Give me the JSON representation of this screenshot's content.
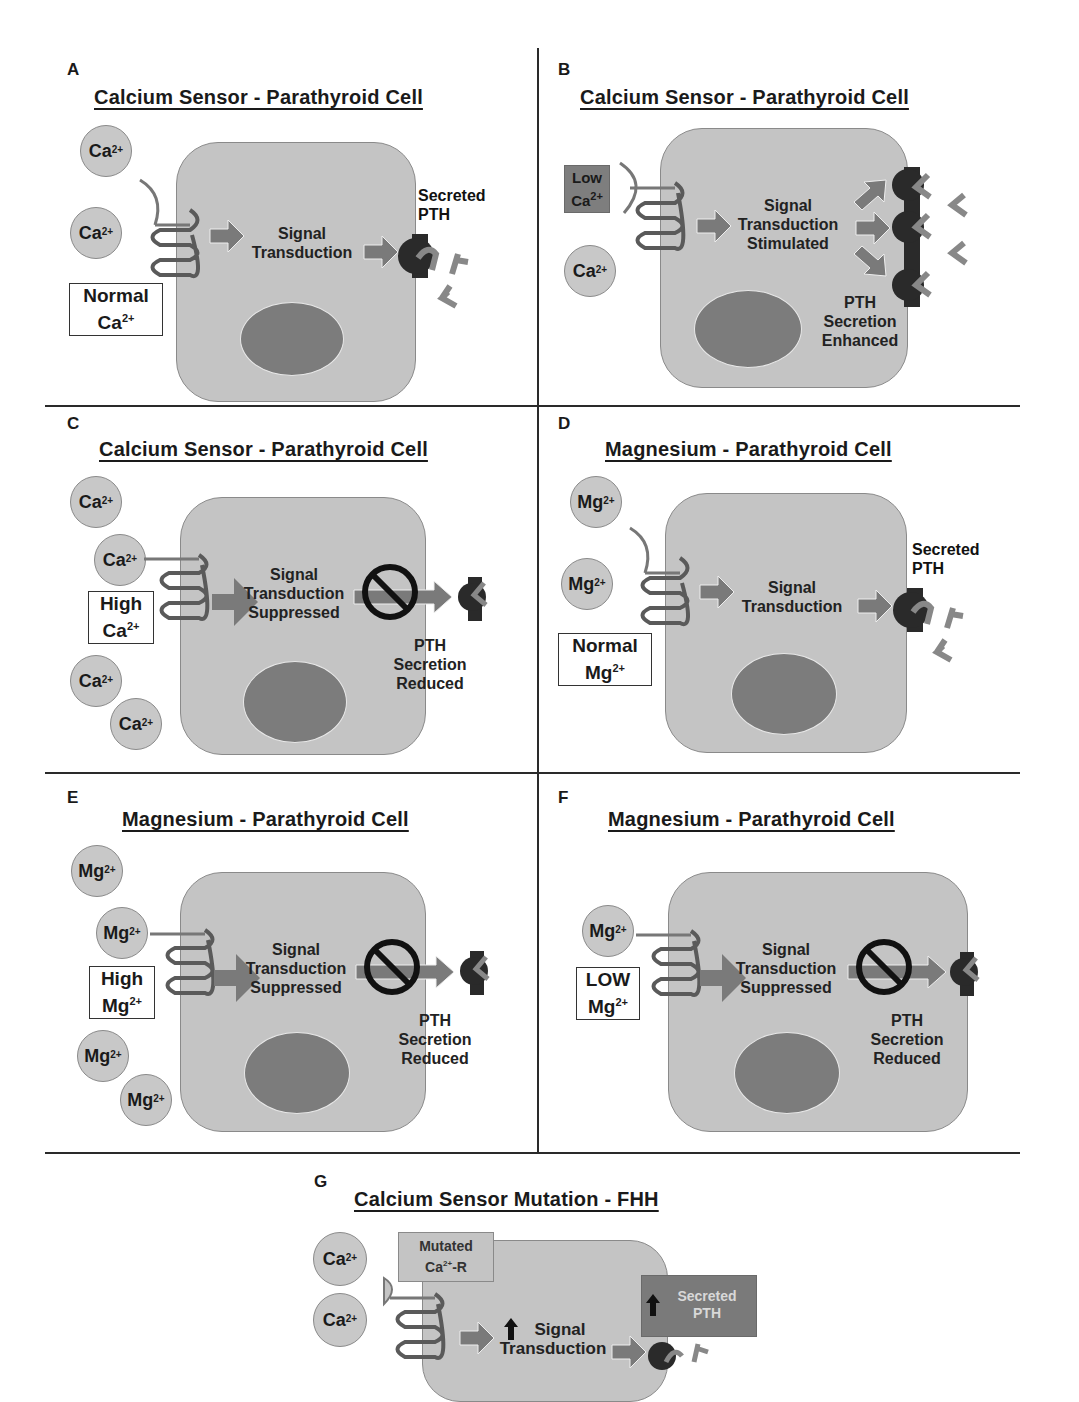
{
  "figure": {
    "panels": [
      {
        "id": "A",
        "title": "Calcium Sensor - Parathyroid Cell",
        "ions": [
          "Ca",
          "Ca"
        ],
        "ion_charge": "2+",
        "state_label": [
          "Normal",
          "Ca"
        ],
        "center_text": [
          "Signal",
          "Transduction"
        ],
        "right_text": [
          "Secreted",
          "PTH"
        ]
      },
      {
        "id": "B",
        "title": "Calcium Sensor - Parathyroid Cell",
        "ions": [
          "Ca"
        ],
        "ion_charge": "2+",
        "state_label": [
          "Low",
          "Ca"
        ],
        "center_text": [
          "Signal",
          "Transduction",
          "Stimulated"
        ],
        "right_text": [
          "PTH",
          "Secretion",
          "Enhanced"
        ]
      },
      {
        "id": "C",
        "title": "Calcium Sensor - Parathyroid Cell",
        "ions": [
          "Ca",
          "Ca",
          "Ca",
          "Ca"
        ],
        "ion_charge": "2+",
        "state_label": [
          "High",
          "Ca"
        ],
        "center_text": [
          "Signal",
          "Transduction",
          "Suppressed"
        ],
        "right_text": [
          "PTH",
          "Secretion",
          "Reduced"
        ]
      },
      {
        "id": "D",
        "title": "Magnesium - Parathyroid Cell",
        "ions": [
          "Mg",
          "Mg"
        ],
        "ion_charge": "2+",
        "state_label": [
          "Normal",
          "Mg"
        ],
        "center_text": [
          "Signal",
          "Transduction"
        ],
        "right_text": [
          "Secreted",
          "PTH"
        ]
      },
      {
        "id": "E",
        "title": "Magnesium - Parathyroid Cell",
        "ions": [
          "Mg",
          "Mg",
          "Mg",
          "Mg"
        ],
        "ion_charge": "2+",
        "state_label": [
          "High",
          "Mg"
        ],
        "center_text": [
          "Signal",
          "Transduction",
          "Suppressed"
        ],
        "right_text": [
          "PTH",
          "Secretion",
          "Reduced"
        ]
      },
      {
        "id": "F",
        "title": "Magnesium - Parathyroid Cell",
        "ions": [
          "Mg"
        ],
        "ion_charge": "2+",
        "state_label": [
          "LOW",
          "Mg"
        ],
        "center_text": [
          "Signal",
          "Transduction",
          "Suppressed"
        ],
        "right_text": [
          "PTH",
          "Secretion",
          "Reduced"
        ]
      },
      {
        "id": "G",
        "title": "Calcium Sensor Mutation - FHH",
        "ions": [
          "Ca",
          "Ca"
        ],
        "ion_charge": "2+",
        "mutated_label": [
          "Mutated",
          "Ca",
          "-R"
        ],
        "center_text": [
          "Signal",
          "Transduction"
        ],
        "right_text": [
          "Secreted",
          "PTH"
        ]
      }
    ],
    "icons": {
      "receptor": "seven-transmembrane-receptor-icon",
      "arrow": "signal-arrow-icon",
      "prohibit": "no-symbol-icon",
      "pth": "pth-molecule-icon",
      "vesicle": "secretory-vesicle-icon",
      "up_arrow": "up-arrow-icon"
    },
    "colors": {
      "cell": "#c4c4c4",
      "nucleus": "#7c7c7c",
      "arrow": "#7a7a7a",
      "vesicle": "#2a2a2a",
      "low_box": "#7e7e7e",
      "secreted_box_g": "#7a7a7a",
      "mutated_box_g": "#c4c4c4"
    }
  }
}
